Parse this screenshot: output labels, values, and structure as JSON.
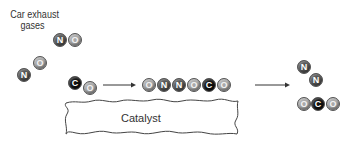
{
  "title": {
    "line1": "Car exhaust",
    "line2": "gases"
  },
  "colors": {
    "N": "#555555",
    "O": "#a9a9a9",
    "C": "#111111",
    "arrow": "#333333"
  },
  "molecules": {
    "no_top": [
      {
        "el": "N"
      },
      {
        "el": "O"
      }
    ],
    "no_left": [
      {
        "el": "N"
      },
      {
        "el": "O"
      }
    ],
    "co": [
      {
        "el": "C"
      },
      {
        "el": "O"
      }
    ],
    "adsorbed": [
      {
        "el": "O"
      },
      {
        "el": "N"
      },
      {
        "el": "N"
      },
      {
        "el": "O"
      },
      {
        "el": "C"
      },
      {
        "el": "O"
      }
    ],
    "n2": [
      {
        "el": "N"
      },
      {
        "el": "N"
      }
    ],
    "co2": [
      {
        "el": "O"
      },
      {
        "el": "C"
      },
      {
        "el": "O"
      }
    ]
  },
  "catalyst": {
    "label": "Catalyst"
  }
}
